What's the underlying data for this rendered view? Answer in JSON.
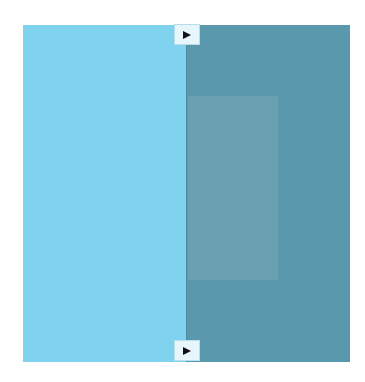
{
  "comparison_slider": {
    "left_color": "#7fd3ef",
    "right_color": "#5a98ad",
    "inner_color": "#6aa0b1",
    "divider_color": "#4f8aa0",
    "handles": {
      "top": {
        "icon": "play-right-icon"
      },
      "bottom": {
        "icon": "play-right-icon"
      }
    }
  }
}
